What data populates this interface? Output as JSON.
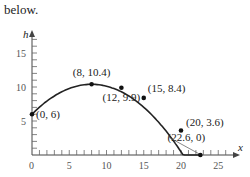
{
  "header_text": "below.",
  "chart_data": {
    "type": "line",
    "title": "",
    "xlabel": "x",
    "ylabel": "h",
    "xlim": [
      0,
      27
    ],
    "ylim": [
      0,
      18
    ],
    "x_ticks": [
      0,
      5,
      10,
      15,
      20,
      25
    ],
    "y_ticks": [
      5,
      10,
      15
    ],
    "grid": false,
    "legend": null,
    "series": [
      {
        "name": "trajectory",
        "points": [
          {
            "x": 0,
            "y": 6,
            "label": "(0, 6)"
          },
          {
            "x": 8,
            "y": 10.4,
            "label": "(8, 10.4)"
          },
          {
            "x": 12,
            "y": 9.9,
            "label": "(12, 9.9)"
          },
          {
            "x": 15,
            "y": 8.4,
            "label": "(15, 8.4)"
          },
          {
            "x": 20,
            "y": 3.6,
            "label": "(20, 3.6)"
          },
          {
            "x": 22.6,
            "y": 0,
            "label": "(22.6, 0)"
          }
        ]
      }
    ]
  }
}
